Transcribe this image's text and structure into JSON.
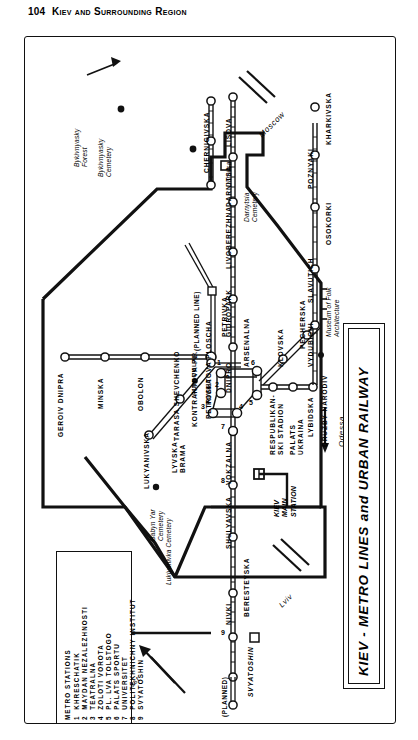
{
  "page": {
    "number": "104",
    "running_head": "Kiev and Surrounding Region"
  },
  "map": {
    "title": "KIEV - METRO LINES and URBAN RAILWAY",
    "orientation_note": "map printed rotated 90 degrees on the page"
  },
  "legend": {
    "heading": "METRO STATIONS",
    "items": [
      {
        "num": "1",
        "label": "KHRESCHATIK"
      },
      {
        "num": "2",
        "label": "MAYDAN NEZALEZHNOSTI"
      },
      {
        "num": "3",
        "label": "TEATRALNA"
      },
      {
        "num": "4",
        "label": "ZOLOTI VOROTA"
      },
      {
        "num": "5",
        "label": "PL. LVA TOLSTOGO"
      },
      {
        "num": "6",
        "label": "PALATS SPORTU"
      },
      {
        "num": "7",
        "label": "UNIVERSITET"
      },
      {
        "num": "8",
        "label": "POLITEKHNICHNY INSTITUT"
      },
      {
        "num": "9",
        "label": "SVYATOSHIN"
      }
    ]
  },
  "stations": {
    "green_line": [
      "GEROIV DNIPRA",
      "MINSKA",
      "OBOLON",
      "PETRIVKA"
    ],
    "red_line": [
      "SVYATOSHIN",
      "NIVKI",
      "BERESTEYSKA",
      "SHULYAVSKA",
      "VOKZALNA",
      "ARSENALNA",
      "DNIPRO",
      "GIDROPARK",
      "LIVOBEREZHNA",
      "DARNITSA",
      "LISOVA"
    ],
    "blue_line": [
      "LUKYANIVSKA",
      "TARASA SHEVCHENKO",
      "KONTRAKTOVA PL.",
      "POSHTOVA PLOSCHA",
      "RESPUBLIKANSKI STADION",
      "PALATS UKRAINA",
      "LYBIDSKA"
    ],
    "east_branch": [
      "DRUZBY NARODIV",
      "VYDUBICHI",
      "SLAVUTICH",
      "OSOKORKI",
      "POZNYAKI",
      "KHARKIVSKA"
    ],
    "pechersk_branch": [
      "KLOVSKA",
      "PECHERSKA"
    ],
    "other": [
      "CHERNIGIVSKA",
      "LYVSKA BRAMA",
      "FUNICULAR"
    ]
  },
  "labels": {
    "bykivnyasky_forest": "Bykivnyasky\nForest",
    "bykivnyasky_cemetery": "Bykivnyasky\nCemetery",
    "darnytsia_cemetery": "Darnytsia\nCemetery",
    "babyn_yar_cemetery": "Babyn Yar\nCemetery",
    "lukiyanivka_cemetery": "Lukiyanivka Cemetery",
    "childrens_railway": "Children's\nRailway",
    "museum_folk_architecture": "Museum of Folk\nArchitecture",
    "kiev_main_station": "KIEV\nMAIN\nSTATION",
    "darnitsa_rail": "Darnitsa",
    "planned_line": "(PLANNED LINE)",
    "planned": "(PLANNED)"
  },
  "directions": {
    "moscow": "Moscow",
    "odessa": "Odessa",
    "lviv": "Lviv",
    "brest": "Brest"
  },
  "station_names": {
    "geroiv_dnipra": "GEROIV DNIPRA",
    "minska": "MINSKA",
    "obolon": "OBOLON",
    "petrivka_up": "PETRIVKA",
    "petrivka": "PETRIVKA",
    "lukyanivska": "LUKYANIVSKA",
    "lyvska_brama": "LYVSKA\nBRAMA",
    "tarasa_shevchenko": "TARASA SHEVCHENKO",
    "kontraktova": "KONTRAKTOVA PL.",
    "poshtova": "POSHTOVA PLOSCHA",
    "funicular": "FUNICULAR",
    "dnipro": "DNIPRO",
    "arsenalna": "ARSENALNA",
    "gidropark": "GIDROPARK",
    "livoberezhna": "LIVOBEREZHNA",
    "darnitsa": "DARNITSA",
    "lisova": "LISOVA",
    "chernigivska": "CHERNIGIVSKA",
    "klovska": "KLOVSKA",
    "pecherska": "PECHERSKA",
    "respublikanski": "RESPUBLIKAN-\nSKI STADION",
    "palats_ukraina": "PALATS\nUKRAINA",
    "lybidska": "LYBIDSKA",
    "druzby_narodiv": "DRUZBY NARODIV",
    "vydubichi": "VYDUBICHI",
    "slavutich": "SLAVUTICH",
    "osokorki": "OSOKORKI",
    "poznyaki": "POZNYAKI",
    "kharkivska": "KHARKIVSKA",
    "vokzalna": "VOKZALNA",
    "shulyavska": "SHULYAVSKA",
    "beresteyska": "BERESTEYSKA",
    "nivki": "NIVKI",
    "svyatoshin": "SVYATOSHIN"
  },
  "numbered_markers": [
    "1",
    "2",
    "3",
    "4",
    "5",
    "6",
    "7",
    "8",
    "9"
  ],
  "colors": {
    "ink": "#111111",
    "paper": "#ffffff"
  }
}
